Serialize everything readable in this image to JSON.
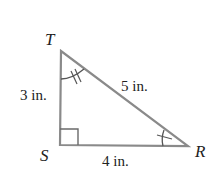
{
  "diagram": {
    "type": "right-triangle",
    "vertices": [
      {
        "name": "T",
        "label": "T"
      },
      {
        "name": "S",
        "label": "S"
      },
      {
        "name": "R",
        "label": "R"
      }
    ],
    "sides": [
      {
        "between": "TS",
        "label": "3 in."
      },
      {
        "between": "TR",
        "label": "5 in."
      },
      {
        "between": "SR",
        "label": "4 in."
      }
    ],
    "angle_marks": {
      "S": "right-angle",
      "T": "double-arc-tick",
      "R": "single-arc-tick"
    },
    "colors": {
      "stroke": "#8a8a8a",
      "text": "#222222",
      "background": "#ffffff"
    }
  }
}
